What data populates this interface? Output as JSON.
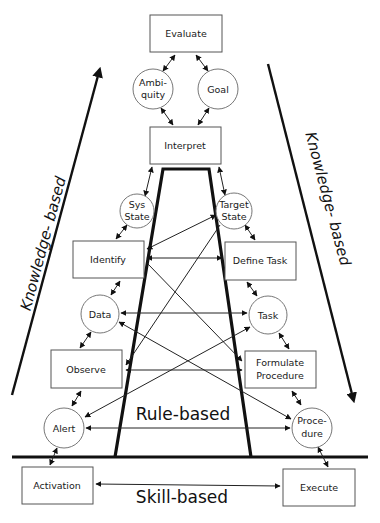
{
  "diagram": {
    "type": "decision-ladder",
    "colors": {
      "line": "#111111",
      "node_stroke": "#666666",
      "background": "#ffffff"
    },
    "nodes": {
      "evaluate": {
        "label": "Evaluate",
        "shape": "box"
      },
      "ambiguity": {
        "label_line1": "Ambi-",
        "label_line2": "quity",
        "shape": "circle"
      },
      "goal": {
        "label": "Goal",
        "shape": "circle"
      },
      "interpret": {
        "label": "Interpret",
        "shape": "box"
      },
      "sys_state": {
        "label_line1": "Sys",
        "label_line2": "State",
        "shape": "circle"
      },
      "target_state": {
        "label_line1": "Target",
        "label_line2": "State",
        "shape": "circle"
      },
      "identify": {
        "label": "Identify",
        "shape": "box"
      },
      "define_task": {
        "label": "Define Task",
        "shape": "box"
      },
      "data": {
        "label": "Data",
        "shape": "circle"
      },
      "task": {
        "label": "Task",
        "shape": "circle"
      },
      "observe": {
        "label": "Observe",
        "shape": "box"
      },
      "formulate_procedure": {
        "label_line1": "Formulate",
        "label_line2": "Procedure",
        "shape": "box"
      },
      "alert": {
        "label": "Alert",
        "shape": "circle"
      },
      "procedure": {
        "label_line1": "Proce-",
        "label_line2": "dure",
        "shape": "circle"
      },
      "activation": {
        "label": "Activation",
        "shape": "box"
      },
      "execute": {
        "label": "Execute",
        "shape": "box"
      }
    },
    "bands": {
      "knowledge_left": "Knowledge- based",
      "knowledge_right": "Knowledge- based",
      "rule": "Rule-based",
      "skill": "Skill-based"
    },
    "edges": [
      [
        "evaluate",
        "ambiguity"
      ],
      [
        "evaluate",
        "goal"
      ],
      [
        "ambiguity",
        "interpret"
      ],
      [
        "goal",
        "interpret"
      ],
      [
        "interpret",
        "sys_state"
      ],
      [
        "interpret",
        "target_state"
      ],
      [
        "sys_state",
        "identify"
      ],
      [
        "target_state",
        "define_task"
      ],
      [
        "identify",
        "data"
      ],
      [
        "define_task",
        "task"
      ],
      [
        "data",
        "observe"
      ],
      [
        "task",
        "formulate_procedure"
      ],
      [
        "observe",
        "alert"
      ],
      [
        "formulate_procedure",
        "procedure"
      ],
      [
        "alert",
        "activation"
      ],
      [
        "procedure",
        "execute"
      ],
      [
        "identify",
        "target_state"
      ],
      [
        "identify",
        "define_task"
      ],
      [
        "identify",
        "formulate_procedure"
      ],
      [
        "target_state",
        "observe"
      ],
      [
        "data",
        "task"
      ],
      [
        "data",
        "procedure"
      ],
      [
        "observe",
        "formulate_procedure"
      ],
      [
        "alert",
        "task"
      ],
      [
        "alert",
        "procedure"
      ],
      [
        "activation",
        "execute"
      ]
    ]
  }
}
